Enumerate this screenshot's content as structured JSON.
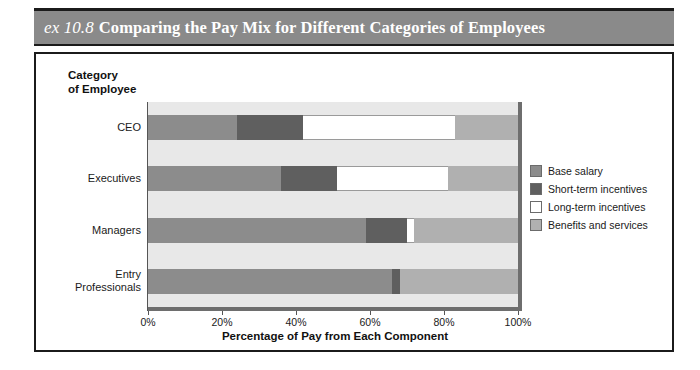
{
  "figure": {
    "exhibit_number": "ex 10.8",
    "title": "Comparing the Pay Mix for Different Categories of Employees"
  },
  "chart_data": {
    "type": "bar",
    "orientation": "horizontal",
    "stacked": true,
    "title": "Comparing the Pay Mix for Different Categories of Employees",
    "xlabel": "Percentage of Pay from Each Component",
    "ylabel": "Category\nof Employee",
    "xlim": [
      0,
      100
    ],
    "xticks": [
      0,
      20,
      40,
      60,
      80,
      100
    ],
    "xticklabels": [
      "0%",
      "20%",
      "40%",
      "60%",
      "80%",
      "100%"
    ],
    "grid": false,
    "legend_position": "right",
    "categories": [
      "CEO",
      "Executives",
      "Managers",
      "Entry\nProfessionals"
    ],
    "series": [
      {
        "name": "Base salary",
        "color": "#8c8c8c",
        "values": [
          24,
          36,
          59,
          66
        ]
      },
      {
        "name": "Short-term incentives",
        "color": "#5f5f5f",
        "values": [
          18,
          15,
          11,
          2
        ]
      },
      {
        "name": "Long-term incentives",
        "color": "#ffffff",
        "values": [
          41,
          30,
          2,
          0
        ]
      },
      {
        "name": "Benefits and services",
        "color": "#b0b0b0",
        "values": [
          17,
          19,
          28,
          32
        ]
      }
    ]
  },
  "legend": {
    "items": [
      {
        "label": "Base salary",
        "color": "#8c8c8c"
      },
      {
        "label": "Short-term incentives",
        "color": "#5f5f5f"
      },
      {
        "label": "Long-term incentives",
        "color": "#ffffff"
      },
      {
        "label": "Benefits and services",
        "color": "#b0b0b0"
      }
    ]
  },
  "colors": {
    "banner": "#8a8a8a",
    "frame": "#1b1b1b",
    "plot_background": "#e8e8e8",
    "axis": "#6e6e6e"
  }
}
